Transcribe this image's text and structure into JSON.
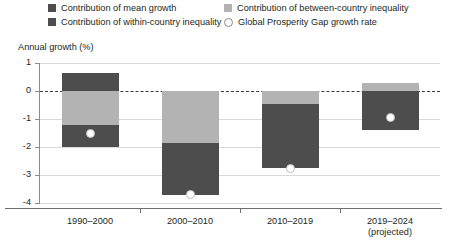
{
  "legend": {
    "items": [
      {
        "label": "Contribution of mean growth",
        "swatch": "dark-square-swatch",
        "color": "#4d4d4d"
      },
      {
        "label": "Contribution of between-country inequality",
        "swatch": "light-square-swatch",
        "color": "#b3b3b3"
      },
      {
        "label": "Contribution of within-country inequality",
        "swatch": "dark-square-swatch",
        "color": "#4d4d4d"
      },
      {
        "label": "Global Prosperity Gap growth rate",
        "swatch": "open-circle-marker",
        "color": "#ffffff"
      }
    ]
  },
  "chart_data": {
    "type": "bar",
    "title": "",
    "ylabel": "Annual growth (%)",
    "xlabel": "",
    "ylim": [
      -4,
      1
    ],
    "yticks": [
      1,
      0,
      -1,
      -2,
      -3,
      -4
    ],
    "ytick_labels": [
      "1",
      "0",
      "-1",
      "-2",
      "-3",
      "-4"
    ],
    "grid": true,
    "zero_line": true,
    "stacked": true,
    "legend_position": "top",
    "categories": [
      "1990–2000",
      "2000–2010",
      "2010–2019",
      "2019–2024"
    ],
    "category_sublabels": [
      "",
      "",
      "",
      "(projected)"
    ],
    "series": [
      {
        "name": "Contribution of mean growth",
        "color": "#4d4d4d",
        "values": [
          0.65,
          0,
          0,
          0
        ]
      },
      {
        "name": "Contribution of between-country inequality",
        "color": "#b3b3b3",
        "values": [
          -1.2,
          -1.85,
          -0.45,
          0.3
        ]
      },
      {
        "name": "Contribution of within-country inequality",
        "color": "#4d4d4d",
        "values": [
          -0.8,
          -1.85,
          -2.3,
          -1.4
        ]
      }
    ],
    "marker_series": {
      "name": "Global Prosperity Gap growth rate",
      "color": "#ffffff",
      "values": [
        -1.5,
        -3.7,
        -2.75,
        -0.95
      ]
    }
  }
}
